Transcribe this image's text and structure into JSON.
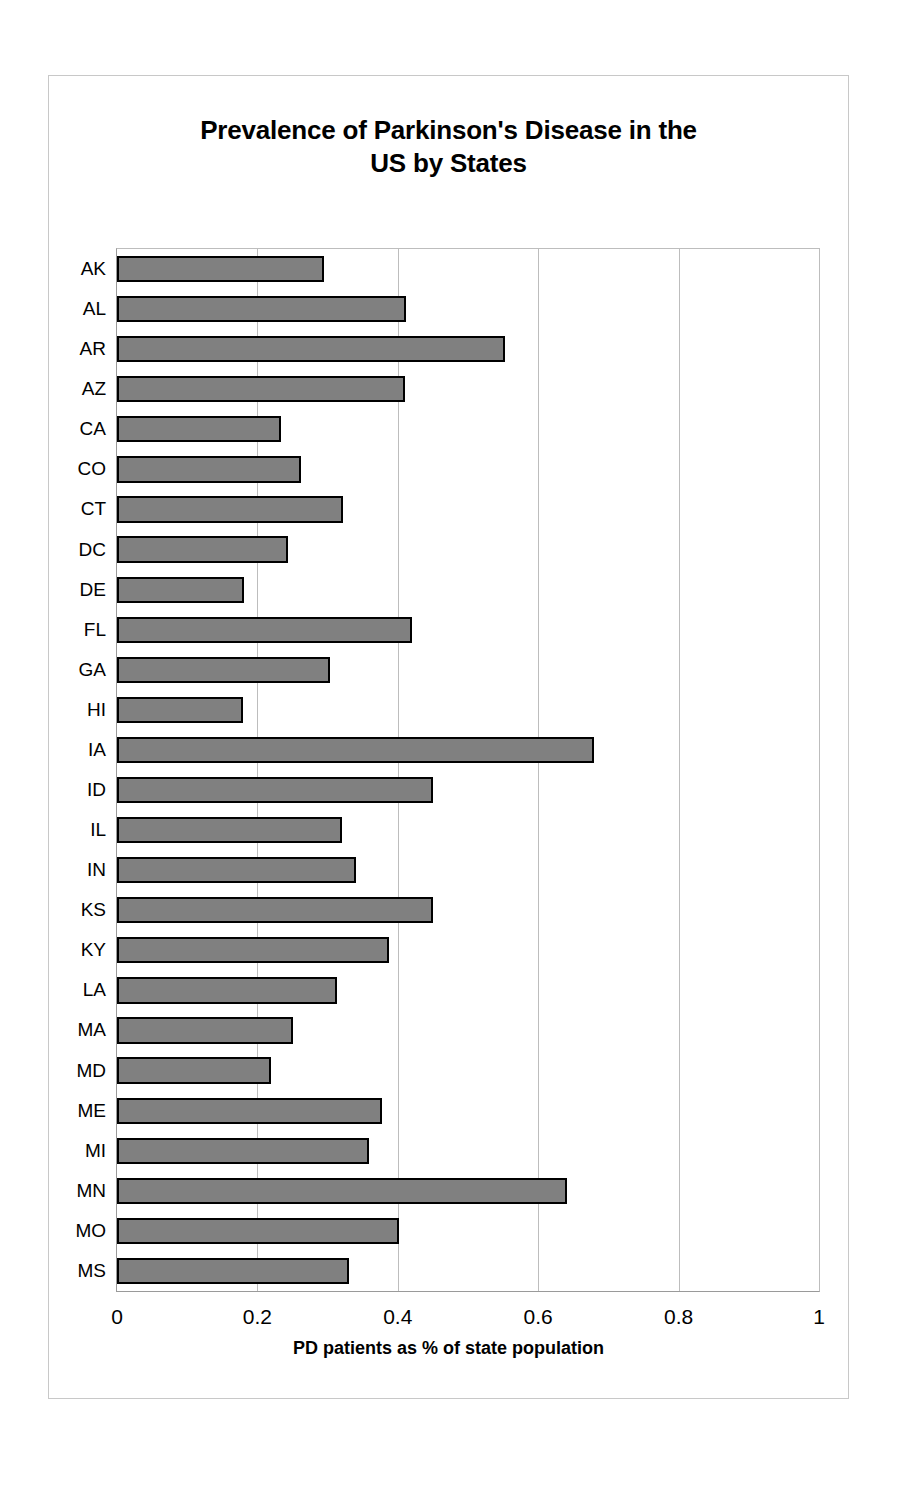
{
  "chart_data": {
    "type": "bar",
    "orientation": "horizontal",
    "title": "Prevalence of Parkinson's Disease in the US by States",
    "title_lines": [
      "Prevalence of Parkinson's Disease in the",
      "US by States"
    ],
    "xlabel": "PD patients as % of state population",
    "ylabel": "",
    "xlim": [
      0,
      1
    ],
    "xticks": [
      0,
      0.2,
      0.4,
      0.6,
      0.8,
      1
    ],
    "xtick_labels": [
      "0",
      "0.2",
      "0.4",
      "0.6",
      "0.8",
      "1"
    ],
    "grid": "vertical",
    "legend": "none",
    "bar_fill_color": "#808080",
    "bar_border_color": "#000000",
    "gridline_color": "#bdbdbd",
    "categories": [
      "AK",
      "AL",
      "AR",
      "AZ",
      "CA",
      "CO",
      "CT",
      "DC",
      "DE",
      "FL",
      "GA",
      "HI",
      "IA",
      "ID",
      "IL",
      "IN",
      "KS",
      "KY",
      "LA",
      "MA",
      "MD",
      "ME",
      "MI",
      "MN",
      "MO",
      "MS"
    ],
    "values": [
      0.295,
      0.412,
      0.553,
      0.41,
      0.233,
      0.262,
      0.322,
      0.243,
      0.181,
      0.42,
      0.303,
      0.18,
      0.68,
      0.45,
      0.32,
      0.34,
      0.45,
      0.387,
      0.313,
      0.25,
      0.219,
      0.378,
      0.359,
      0.641,
      0.401,
      0.331
    ]
  }
}
